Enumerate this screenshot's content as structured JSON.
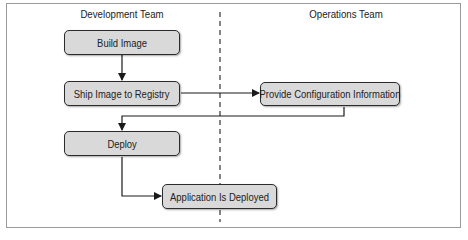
{
  "diagram": {
    "lanes": [
      {
        "id": "dev",
        "label": "Development Team"
      },
      {
        "id": "ops",
        "label": "Operations Team"
      }
    ],
    "nodes": [
      {
        "id": "build",
        "label": "Build Image",
        "lane": "dev"
      },
      {
        "id": "ship",
        "label": "Ship Image to Registry",
        "lane": "dev"
      },
      {
        "id": "config",
        "label": "Provide Configuration Information",
        "lane": "ops"
      },
      {
        "id": "deploy",
        "label": "Deploy",
        "lane": "dev"
      },
      {
        "id": "deployed",
        "label": "Application Is Deployed",
        "lane": "dev/ops"
      }
    ],
    "edges": [
      {
        "from": "build",
        "to": "ship"
      },
      {
        "from": "ship",
        "to": "config"
      },
      {
        "from": "config",
        "to": "deploy"
      },
      {
        "from": "deploy",
        "to": "deployed"
      }
    ],
    "colors": {
      "node_fill": "#d9d9d9",
      "node_border": "#2b2b2b",
      "line": "#1a1a1a",
      "frame": "#9a9a9a"
    }
  }
}
